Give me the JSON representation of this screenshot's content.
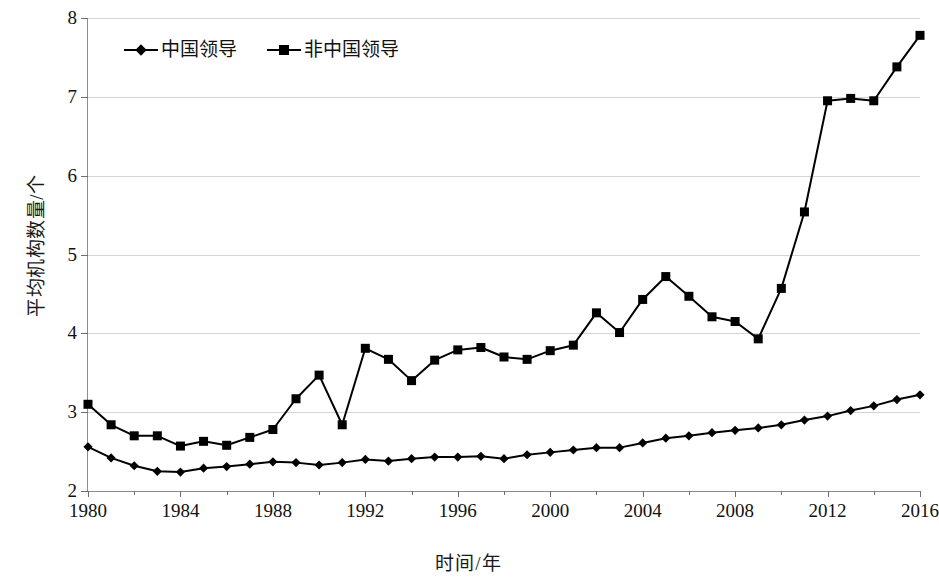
{
  "chart_data": {
    "type": "line",
    "title": "",
    "xlabel": "时间/年",
    "ylabel": "平均机构数量/个",
    "xlim": [
      1980,
      2016
    ],
    "ylim": [
      2,
      8
    ],
    "ytick_labels": [
      "2",
      "3",
      "4",
      "5",
      "6",
      "7",
      "8"
    ],
    "ytick_values": [
      2,
      3,
      4,
      5,
      6,
      7,
      8
    ],
    "xtick_labels": [
      "1980",
      "1984",
      "1988",
      "1992",
      "1996",
      "2000",
      "2004",
      "2008",
      "2012",
      "2016"
    ],
    "xtick_values": [
      1980,
      1984,
      1988,
      1992,
      1996,
      2000,
      2004,
      2008,
      2012,
      2016
    ],
    "xminor_values": [
      1982,
      1986,
      1990,
      1994,
      1998,
      2002,
      2006,
      2010,
      2014
    ],
    "grid": true,
    "legend_position": "top-left",
    "x": [
      1980,
      1981,
      1982,
      1983,
      1984,
      1985,
      1986,
      1987,
      1988,
      1989,
      1990,
      1991,
      1992,
      1993,
      1994,
      1995,
      1996,
      1997,
      1998,
      1999,
      2000,
      2001,
      2002,
      2003,
      2004,
      2005,
      2006,
      2007,
      2008,
      2009,
      2010,
      2011,
      2012,
      2013,
      2014,
      2015,
      2016
    ],
    "series": [
      {
        "name": "中国领导",
        "marker": "diamond",
        "color": "#000000",
        "values": [
          2.56,
          2.42,
          2.32,
          2.25,
          2.24,
          2.29,
          2.31,
          2.34,
          2.37,
          2.36,
          2.33,
          2.36,
          2.4,
          2.38,
          2.41,
          2.43,
          2.43,
          2.44,
          2.41,
          2.46,
          2.49,
          2.52,
          2.55,
          2.55,
          2.61,
          2.67,
          2.7,
          2.74,
          2.77,
          2.8,
          2.84,
          2.9,
          2.95,
          3.02,
          3.08,
          3.16,
          3.22
        ]
      },
      {
        "name": "非中国领导",
        "marker": "square",
        "color": "#000000",
        "values": [
          3.1,
          2.84,
          2.7,
          2.7,
          2.57,
          2.63,
          2.58,
          2.68,
          2.78,
          3.17,
          3.47,
          2.84,
          3.81,
          3.67,
          3.4,
          3.66,
          3.79,
          3.82,
          3.7,
          3.67,
          3.78,
          3.85,
          4.26,
          4.01,
          4.43,
          4.72,
          4.47,
          4.21,
          4.15,
          3.93,
          4.57,
          5.54,
          6.95,
          6.98,
          6.95,
          7.38,
          7.78
        ]
      }
    ]
  }
}
